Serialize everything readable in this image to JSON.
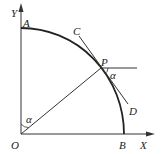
{
  "diagram": {
    "axes": {
      "x_label": "X",
      "y_label": "Y"
    },
    "points": {
      "origin": "O",
      "a": "A",
      "b": "B",
      "c": "C",
      "d": "D",
      "p": "P"
    },
    "angles": {
      "at_origin": "α",
      "at_p": "α"
    }
  }
}
